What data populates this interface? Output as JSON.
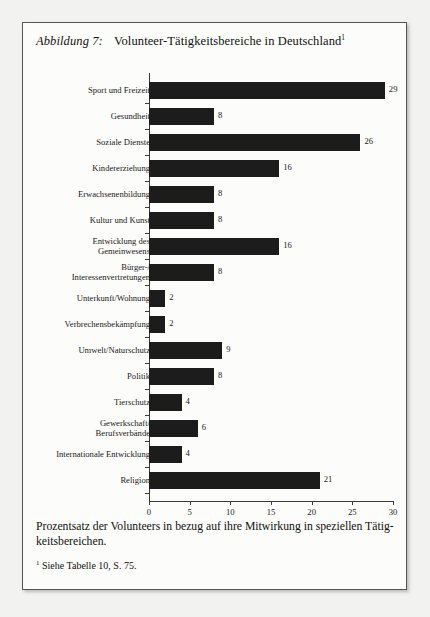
{
  "figure": {
    "caption_label": "Abbildung 7:",
    "title": "Volunteer-Tätigkeitsbereiche in Deutschland",
    "title_footnote_marker": "1",
    "description": "Prozentsatz der Volunteers in bezug auf ihre Mitwirkung in speziellen Tätig-keitsbereichen.",
    "footnote_marker": "1",
    "footnote_text": "Siehe Tabelle 10, S. 75."
  },
  "chart_data": {
    "type": "bar",
    "orientation": "horizontal",
    "title": "Volunteer-Tätigkeitsbereiche in Deutschland",
    "xlabel": "",
    "ylabel": "",
    "xlim": [
      0,
      30
    ],
    "xticks": [
      0,
      5,
      10,
      15,
      20,
      25,
      30
    ],
    "grid": false,
    "legend": null,
    "bar_color": "#1c1c1c",
    "categories": [
      "Sport und Freizeit",
      "Gesundheit",
      "Soziale Dienste",
      "Kindererziehung",
      "Erwachsenenbildung",
      "Kultur und Kunst",
      "Entwicklung des\nGemeinwesens",
      "Bürger-/\nInteressenvertretungen",
      "Unterkunft/Wohnung",
      "Verbrechensbekämpfung",
      "Umwelt/Naturschutz",
      "Politik",
      "Tierschutz",
      "Gewerkschaft/\nBerufsverbände",
      "Internationale Entwicklung",
      "Religion"
    ],
    "values": [
      29,
      8,
      26,
      16,
      8,
      8,
      16,
      8,
      2,
      2,
      9,
      8,
      4,
      6,
      4,
      21
    ],
    "data_labels": [
      "29",
      "8",
      "26",
      "16",
      "8",
      "8",
      "16",
      "8",
      "2",
      "2",
      "9",
      "8",
      "4",
      "6",
      "4",
      "21"
    ]
  }
}
